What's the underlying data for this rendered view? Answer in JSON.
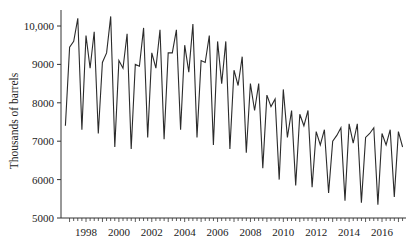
{
  "chart_data": {
    "type": "line",
    "title": "",
    "xlabel": "",
    "ylabel": "Thousands of barrels",
    "ylim": [
      5000,
      10500
    ],
    "xlim": [
      1996.75,
      2017.25
    ],
    "grid": false,
    "legend": null,
    "y_ticks": [
      5000,
      6000,
      7000,
      8000,
      9000,
      10000
    ],
    "y_tick_labels": [
      "5000",
      "6000",
      "7000",
      "8000",
      "9000",
      "10,000"
    ],
    "x_ticks": [
      1998,
      2000,
      2002,
      2004,
      2006,
      2008,
      2010,
      2012,
      2014,
      2016
    ],
    "x_tick_labels": [
      "1998",
      "2000",
      "2002",
      "2004",
      "2006",
      "2008",
      "2010",
      "2012",
      "2014",
      "2016"
    ],
    "x_minor_ticks": "quarterly",
    "series": [
      {
        "name": "Thousands of barrels",
        "frequency": "quarterly",
        "start": 1996.75,
        "values": [
          7400,
          9450,
          9600,
          10200,
          7300,
          9750,
          8900,
          9850,
          7200,
          9050,
          9300,
          10250,
          6850,
          9100,
          8900,
          9800,
          6800,
          9000,
          8950,
          9950,
          7100,
          9300,
          8900,
          9900,
          7050,
          9300,
          9300,
          9900,
          7300,
          9500,
          8800,
          10050,
          7100,
          9100,
          9050,
          9750,
          6900,
          9600,
          8500,
          9600,
          6800,
          8850,
          8450,
          9200,
          6700,
          8500,
          7800,
          8500,
          6300,
          8200,
          7900,
          8100,
          6000,
          8350,
          7100,
          7800,
          5850,
          7700,
          7400,
          7800,
          5800,
          7250,
          6900,
          7300,
          5650,
          7000,
          7150,
          7350,
          5450,
          7450,
          6950,
          7450,
          5400,
          7100,
          7200,
          7350,
          5350,
          7200,
          6900,
          7300,
          5550,
          7250,
          6850
        ]
      }
    ]
  }
}
